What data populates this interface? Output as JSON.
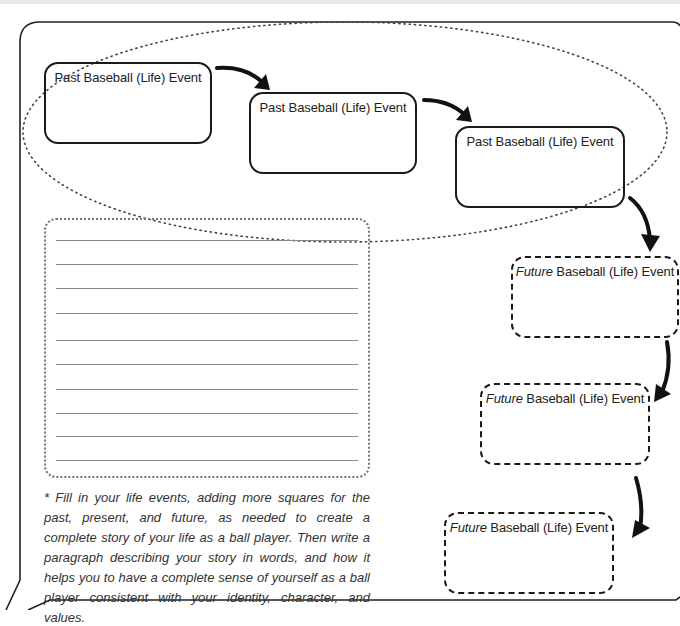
{
  "worksheet": {
    "past_events": [
      {
        "label": "Past Baseball (Life) Event"
      },
      {
        "label": "Past Baseball (Life) Event"
      },
      {
        "label": "Past Baseball (Life) Event"
      }
    ],
    "future_events": [
      {
        "prefix": "Future",
        "label": " Baseball (Life) Event"
      },
      {
        "prefix": "Future",
        "label": " Baseball (Life) Event"
      },
      {
        "prefix": "Future",
        "label": " Baseball (Life) Event"
      }
    ],
    "writing_area": {
      "line_count": 10
    },
    "instructions": "* Fill in your life events, adding more squares for the past, present, and future, as needed to create a complete story of your life as a ball player. Then write a paragraph describing your story in words, and how it helps you to have a complete sense of yourself as a ball player consistent with your identity, character, and values."
  }
}
